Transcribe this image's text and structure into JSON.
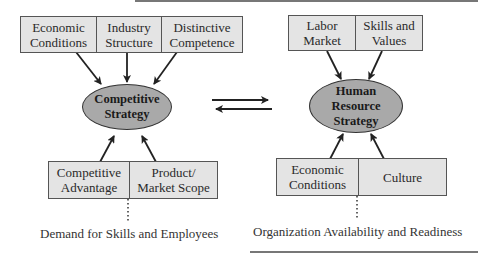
{
  "left": {
    "top_boxes": [
      "Economic\nConditions",
      "Industry\nStructure",
      "Distinctive\nCompetence"
    ],
    "center": "Competitive\nStrategy",
    "bottom_boxes": [
      "Competitive\nAdvantage",
      "Product/\nMarket Scope"
    ],
    "caption": "Demand for Skills and Employees"
  },
  "right": {
    "top_boxes": [
      "Labor\nMarket",
      "Skills and\nValues"
    ],
    "center": "Human\nResource\nStrategy",
    "bottom_boxes": [
      "Economic\nConditions",
      "Culture"
    ],
    "caption": "Organization Availability and Readiness"
  },
  "colors": {
    "box_fill": "#e4e4e4",
    "ellipse_fill": "#a9a9a9",
    "line": "#2a2a2a"
  }
}
